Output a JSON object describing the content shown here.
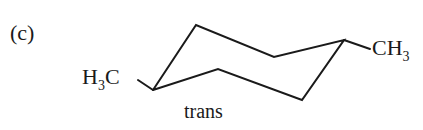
{
  "figure": {
    "part_label": "(c)",
    "left_substituent": {
      "main": "H",
      "sub": "3",
      "tail": "C"
    },
    "right_substituent": {
      "main": "CH",
      "sub": "3"
    },
    "caption": "trans",
    "molecule": "trans-1,4-dimethylcyclohexane (chair conformation)",
    "stroke_color": "#1a1a1a"
  }
}
